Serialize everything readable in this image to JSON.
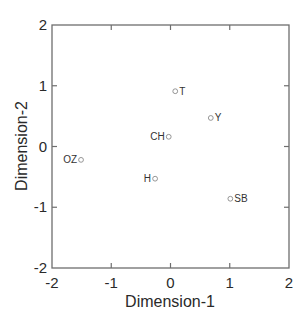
{
  "chart_data": {
    "type": "scatter",
    "title": "",
    "xlabel": "Dimension-1",
    "ylabel": "Dimension-2",
    "xlim": [
      -2,
      2
    ],
    "ylim": [
      -2,
      2
    ],
    "xticks": [
      -2,
      -1,
      0,
      1,
      2
    ],
    "yticks": [
      -2,
      -1,
      0,
      1,
      2
    ],
    "grid": false,
    "legend": null,
    "points": [
      {
        "label": "T",
        "x": 0.08,
        "y": 0.91,
        "label_side": "right"
      },
      {
        "label": "Y",
        "x": 0.68,
        "y": 0.47,
        "label_side": "right"
      },
      {
        "label": "CH",
        "x": -0.03,
        "y": 0.16,
        "label_side": "left"
      },
      {
        "label": "OZ",
        "x": -1.51,
        "y": -0.22,
        "label_side": "left"
      },
      {
        "label": "H",
        "x": -0.26,
        "y": -0.53,
        "label_side": "left"
      },
      {
        "label": "SB",
        "x": 1.01,
        "y": -0.86,
        "label_side": "right"
      }
    ],
    "marker": "open-circle",
    "axis_color": "#6e6e6e",
    "marker_color": "#8a8a8a"
  }
}
